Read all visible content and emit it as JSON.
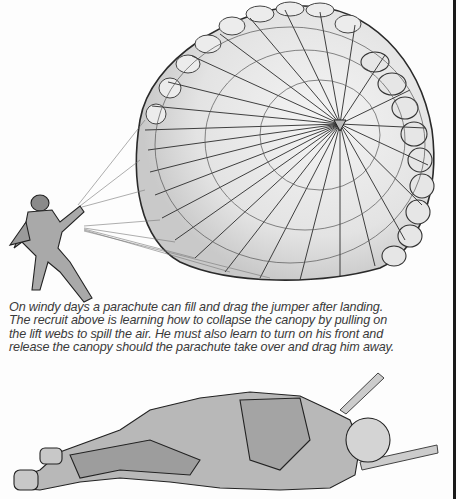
{
  "page": {
    "background": "#fdfdfd",
    "rule_color": "#1a1a1a"
  },
  "illustrations": {
    "top": {
      "subject": "parachutist-collapsing-canopy",
      "description": "Soldier pulling on lift webs of an inflated parachute canopy"
    },
    "bottom": {
      "subject": "parachutist-lying-on-front",
      "description": "Soldier lying on his front releasing the canopy"
    }
  },
  "caption": {
    "lines": [
      "On windy days a parachute can fill and drag the jumper after landing.",
      "The recruit above is learning how to collapse the canopy by pulling on",
      "the lift webs to spill the air. He must also learn to turn on his front and",
      "release the canopy should the parachute take over and drag him away."
    ]
  }
}
